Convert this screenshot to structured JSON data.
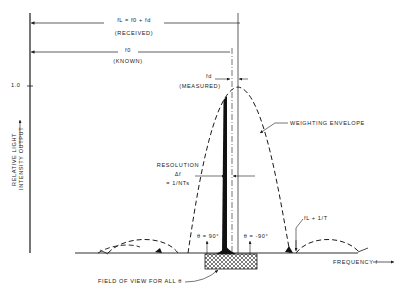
{
  "diagram": {
    "received_label": {
      "formula": "fL = f0 + fd",
      "note": "(RECEIVED)"
    },
    "known_label": {
      "formula": "f0",
      "note": "(KNOWN)"
    },
    "measured_label": {
      "formula": "fd",
      "note": "(MEASURED)"
    },
    "y_tick": "1.0",
    "y_axis_label_line1": "RELATIVE LIGHT",
    "y_axis_label_line2": "INTENSITY OUTPUT",
    "envelope_label": "WEIGHTING ENVELOPE",
    "resolution_label": {
      "line1": "RESOLUTION",
      "line2": "Δf",
      "line3": "= 1/NTs"
    },
    "theta_pos": "θ = 90°",
    "theta_neg": "θ = -90°",
    "sidelobe_marker": "fL + 1/T",
    "x_axis_label": "FREQUENCY  f",
    "field_of_view_label": "FIELD OF VIEW FOR ALL θ"
  },
  "colors": {
    "ink": "#1a1a1a",
    "background": "#ffffff"
  }
}
